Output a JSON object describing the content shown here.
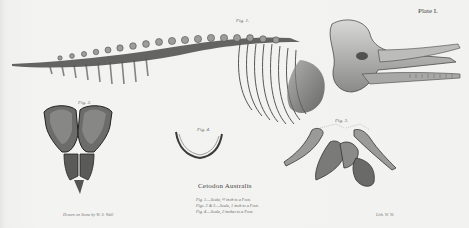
{
  "plate": {
    "label": "Plate I.",
    "species_title": "Cetodon Australis",
    "figure_labels": {
      "fig1": "Fig. 1.",
      "fig2": "Fig. 2.",
      "fig3": "Fig. 3.",
      "fig4": "Fig. 4."
    },
    "scale_notes": [
      "Fig. 1.—Scale, ½ inch to a Foot.",
      "Figs. 2 & 3.—Scale, 1 inch to a Foot.",
      "Fig. 4.—Scale, 2 inches to a Foot."
    ],
    "credit_left": "Drawn on Stone by W. S. Wall",
    "credit_right": "Lith. W. W."
  },
  "colors": {
    "paper": "#f2f2f0",
    "ink_dark": "#2a2a2a",
    "ink_mid": "#6a6a6a",
    "ink_light": "#a8a8a8"
  }
}
